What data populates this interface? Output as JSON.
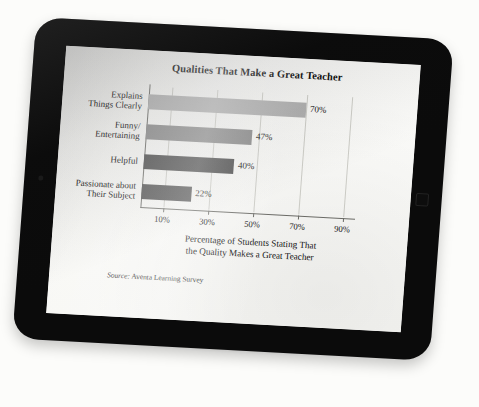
{
  "device": {
    "type_label": "tablet",
    "bezel_color": "#0b0b0b",
    "screen_bg": "#fbfbf9",
    "home_button_label": "",
    "camera_label": ""
  },
  "chart_data": {
    "type": "bar",
    "orientation": "horizontal",
    "title": "Qualities That Make a Great Teacher",
    "subtitle": "",
    "categories": [
      "Explains\nThings Clearly",
      "Funny/\nEntertaining",
      "Helpful",
      "Passionate about\nTheir Subject"
    ],
    "category_lines": [
      [
        "Explains",
        "Things Clearly"
      ],
      [
        "Funny/",
        "Entertaining"
      ],
      [
        "Helpful"
      ],
      [
        "Passionate about",
        "Their Subject"
      ]
    ],
    "values": [
      70,
      47,
      40,
      22
    ],
    "value_labels": [
      "70%",
      "47%",
      "40%",
      "22%"
    ],
    "bar_colors": [
      "#b3b3b3",
      "#8c8c8c",
      "#4c4c4c",
      "#535353"
    ],
    "xlabel": "Percentage of Students Stating That the Quality Makes a Great Teacher",
    "xlabel_lines": [
      "Percentage of Students Stating That",
      "the Quality Makes a Great Teacher"
    ],
    "ylabel": "",
    "xlim": [
      0,
      95
    ],
    "xticks": [
      10,
      30,
      50,
      70,
      90
    ],
    "xtick_labels": [
      "10%",
      "30%",
      "50%",
      "70%",
      "90%"
    ],
    "grid": true,
    "grid_axis": "x",
    "legend": null,
    "legend_position": "none",
    "annotations": []
  },
  "source_note": {
    "prefix": "Source:",
    "text": " Aventa Learning Survey",
    "full": "Source: Aventa Learning Survey"
  }
}
